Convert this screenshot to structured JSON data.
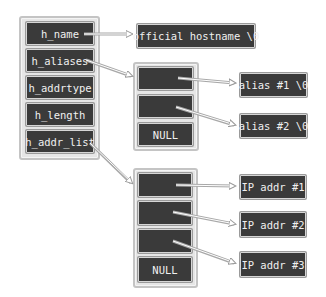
{
  "hostent": {
    "fields": [
      "h_name",
      "h_aliases",
      "h_addrtype",
      "h_length",
      "h_addr_list"
    ]
  },
  "hostname": {
    "label": "official hostname \\0"
  },
  "aliases_array": {
    "cells": [
      "",
      "",
      "NULL"
    ]
  },
  "aliases": [
    "alias #1 \\0",
    "alias #2 \\0"
  ],
  "addr_array": {
    "cells": [
      "",
      "",
      "",
      "NULL"
    ]
  },
  "addresses": [
    "IP addr #1",
    "IP addr #2",
    "IP addr #3"
  ],
  "colors": {
    "cell": "#3a3a3a",
    "container": "#e6e6e6",
    "border": "#c4c4c4",
    "arrow": "#9a9a9a"
  }
}
